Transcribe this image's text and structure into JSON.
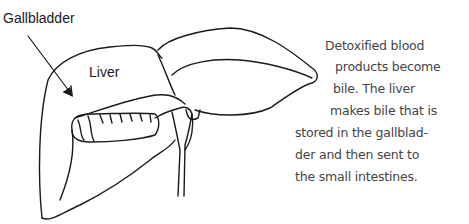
{
  "labels": {
    "gallbladder": "Gallbladder",
    "liver": "Liver"
  },
  "caption": {
    "lines": [
      "Detoxified blood",
      "products become",
      "bile. The liver",
      "makes bile that is",
      "stored in the gallblad-",
      "der and then sent to",
      "the small intestines."
    ]
  },
  "colors": {
    "ink": "#1a1a1a",
    "caption_text": "#444444",
    "background": "#ffffff"
  }
}
